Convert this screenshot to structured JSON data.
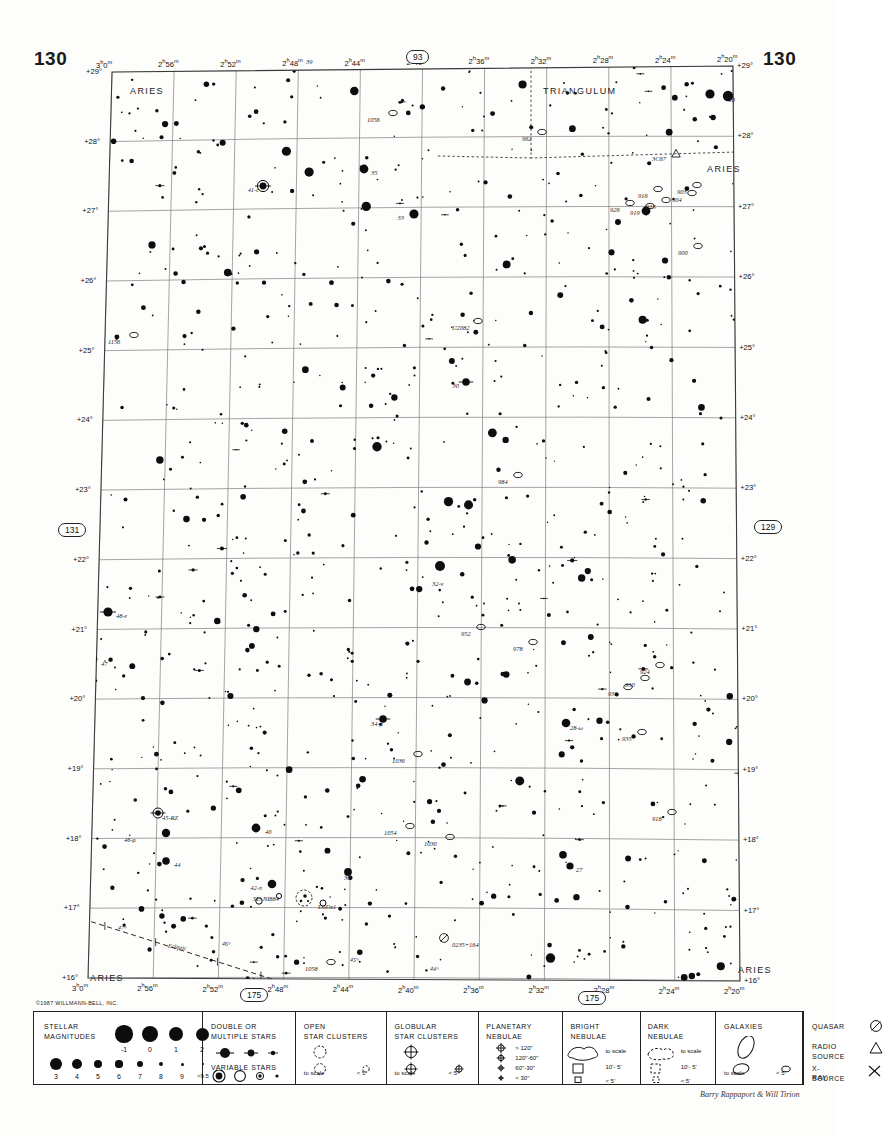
{
  "page": {
    "number_left": "130",
    "number_right": "130",
    "copyright": "©1987 WILLMANN-BELL, INC.",
    "signature": "Barry Rappaport & Will Tirion"
  },
  "badges": {
    "top": "93",
    "left": "131",
    "right": "129",
    "bottom_left": "175",
    "bottom_right": "175"
  },
  "chart_data": {
    "type": "scatter",
    "xlabel": "Right Ascension",
    "ylabel": "Declination",
    "xlim": [
      "2h20m",
      "3h0m"
    ],
    "ylim": [
      16,
      29
    ],
    "grid": true,
    "ra_ticks": [
      {
        "label": "3h 0m",
        "h": "3",
        "m": "0"
      },
      {
        "label": "2h 56m",
        "h": "2",
        "m": "56"
      },
      {
        "label": "2h 52m",
        "h": "2",
        "m": "52"
      },
      {
        "label": "2h 48m",
        "h": "2",
        "m": "48"
      },
      {
        "label": "2h 44m",
        "h": "2",
        "m": "44"
      },
      {
        "label": "2h 40m",
        "h": "2",
        "m": "40"
      },
      {
        "label": "2h 36m",
        "h": "2",
        "m": "36"
      },
      {
        "label": "2h 32m",
        "h": "2",
        "m": "32"
      },
      {
        "label": "2h 28m",
        "h": "2",
        "m": "28"
      },
      {
        "label": "2h 24m",
        "h": "2",
        "m": "24"
      },
      {
        "label": "2h 20m",
        "h": "2",
        "m": "20"
      }
    ],
    "dec_ticks": [
      "+29°",
      "+28°",
      "+27°",
      "+26°",
      "+25°",
      "+24°",
      "+23°",
      "+22°",
      "+21°",
      "+20°",
      "+19°",
      "+18°",
      "+17°",
      "+16°"
    ],
    "constellations": [
      {
        "name": "ARIES",
        "x": 130,
        "y": 86
      },
      {
        "name": "TRIANGULUM",
        "x": 543,
        "y": 86
      },
      {
        "name": "ARIES",
        "x": 707,
        "y": 164
      },
      {
        "name": "ARIES",
        "x": 90,
        "y": 973
      },
      {
        "name": "ARIES",
        "x": 738,
        "y": 965
      }
    ],
    "ecliptic": {
      "label": "Ecliptic",
      "tick_labels": [
        "47°",
        "46°",
        "45°",
        "44°"
      ]
    },
    "star_labels": [
      {
        "text": "39",
        "x": 306,
        "y": 58,
        "align": "left"
      },
      {
        "text": "10",
        "x": 735,
        "y": 96,
        "align": "right"
      },
      {
        "text": "35",
        "x": 371,
        "y": 169,
        "align": "left"
      },
      {
        "text": "41-c",
        "x": 259,
        "y": 186,
        "align": "right"
      },
      {
        "text": "33",
        "x": 404,
        "y": 214,
        "align": "right"
      },
      {
        "text": "30",
        "x": 459,
        "y": 382,
        "align": "right"
      },
      {
        "text": "32-ν",
        "x": 432,
        "y": 580,
        "align": "left"
      },
      {
        "text": "48-ε",
        "x": 116,
        "y": 612,
        "align": "left"
      },
      {
        "text": "47",
        "x": 101,
        "y": 660,
        "align": "left"
      },
      {
        "text": "34-μ",
        "x": 371,
        "y": 720,
        "align": "left"
      },
      {
        "text": "28-ω",
        "x": 570,
        "y": 724,
        "align": "left"
      },
      {
        "text": "45-RZ",
        "x": 162,
        "y": 814,
        "align": "left"
      },
      {
        "text": "46-ρ",
        "x": 124,
        "y": 836,
        "align": "left"
      },
      {
        "text": "40",
        "x": 265,
        "y": 828,
        "align": "left"
      },
      {
        "text": "44",
        "x": 174,
        "y": 861,
        "align": "left"
      },
      {
        "text": "27",
        "x": 576,
        "y": 866,
        "align": "left"
      },
      {
        "text": "36",
        "x": 344,
        "y": 874,
        "align": "left"
      },
      {
        "text": "42-π",
        "x": 262,
        "y": 884,
        "align": "right"
      },
      {
        "text": "SU-NI884",
        "x": 253,
        "y": 895,
        "align": "left"
      }
    ],
    "deepsky_labels": [
      {
        "text": "1056",
        "x": 367,
        "y": 116,
        "type": "galaxy"
      },
      {
        "text": "962",
        "x": 522,
        "y": 135,
        "type": "galaxy"
      },
      {
        "text": "3C67",
        "x": 652,
        "y": 155,
        "type": "radio-source"
      },
      {
        "text": "903",
        "x": 677,
        "y": 188,
        "type": "galaxy"
      },
      {
        "text": "904",
        "x": 672,
        "y": 196,
        "type": "galaxy"
      },
      {
        "text": "916",
        "x": 638,
        "y": 192,
        "type": "galaxy"
      },
      {
        "text": "915",
        "x": 646,
        "y": 203,
        "type": "galaxy"
      },
      {
        "text": "926",
        "x": 610,
        "y": 206,
        "type": "galaxy"
      },
      {
        "text": "919",
        "x": 630,
        "y": 209,
        "type": "galaxy"
      },
      {
        "text": "900",
        "x": 678,
        "y": 249,
        "type": "galaxy"
      },
      {
        "text": "1156",
        "x": 108,
        "y": 338,
        "type": "galaxy"
      },
      {
        "text": "U2082",
        "x": 452,
        "y": 324,
        "type": "galaxy"
      },
      {
        "text": "984",
        "x": 498,
        "y": 478,
        "type": "galaxy"
      },
      {
        "text": "952",
        "x": 461,
        "y": 630,
        "type": "galaxy"
      },
      {
        "text": "978",
        "x": 513,
        "y": 645,
        "type": "galaxy"
      },
      {
        "text": "924",
        "x": 640,
        "y": 668,
        "type": "galaxy"
      },
      {
        "text": "930",
        "x": 625,
        "y": 681,
        "type": "galaxy"
      },
      {
        "text": "938",
        "x": 608,
        "y": 690,
        "type": "galaxy"
      },
      {
        "text": "935",
        "x": 622,
        "y": 735,
        "type": "galaxy"
      },
      {
        "text": "1036",
        "x": 392,
        "y": 757,
        "type": "galaxy"
      },
      {
        "text": "918",
        "x": 652,
        "y": 815,
        "type": "galaxy"
      },
      {
        "text": "1054",
        "x": 384,
        "y": 829,
        "type": "galaxy"
      },
      {
        "text": "1030",
        "x": 424,
        "y": 840,
        "type": "galaxy"
      },
      {
        "text": "DoDz1",
        "x": 318,
        "y": 903,
        "type": "open-cluster"
      },
      {
        "text": "0235+164",
        "x": 452,
        "y": 941,
        "type": "quasar"
      },
      {
        "text": "1058",
        "x": 305,
        "y": 965,
        "type": "galaxy"
      }
    ]
  },
  "legend": {
    "stellar_magnitudes": {
      "title_line1": "STELLAR",
      "title_line2": "MAGNITUDES",
      "top_row": [
        "-1",
        "0",
        "1",
        "2"
      ],
      "bottom_row": [
        "3",
        "4",
        "5",
        "6",
        "7",
        "8",
        "9",
        ">9.5"
      ]
    },
    "double_stars": {
      "title_line1": "DOUBLE  OR",
      "title_line2": "MULTIPLE  STARS",
      "variable_title": "VARIABLE  STARS"
    },
    "open_clusters": {
      "title_line1": "OPEN",
      "title_line2": "STAR CLUSTERS",
      "scale_label": "to scale",
      "small_label": "< 5'"
    },
    "globular_clusters": {
      "title_line1": "GLOBULAR",
      "title_line2": "STAR CLUSTERS",
      "scale_label": "to scale",
      "small_label": "< 5'"
    },
    "planetary_nebulae": {
      "title_line1": "PLANETARY",
      "title_line2": "NEBULAE",
      "items": [
        "> 120\"",
        "120\"-60\"",
        "60\"-30\"",
        "< 30\""
      ]
    },
    "bright_nebulae": {
      "title_line1": "BRIGHT",
      "title_line2": "NEBULAE",
      "items": [
        "to scale",
        "10'- 5'",
        "< 5'"
      ]
    },
    "dark_nebulae": {
      "title_line1": "DARK",
      "title_line2": "NEBULAE",
      "items": [
        "to scale",
        "10'- 5'",
        "< 5'"
      ]
    },
    "galaxies": {
      "title": "GALAXIES",
      "scale_label": "to scale",
      "small_label": "< 5'"
    },
    "quasar": {
      "quasar_label": "QUASAR",
      "radio_line1": "RADIO",
      "radio_line2": "SOURCE",
      "xray_line1": "X-RAY",
      "xray_line2": "SOURCE"
    }
  }
}
